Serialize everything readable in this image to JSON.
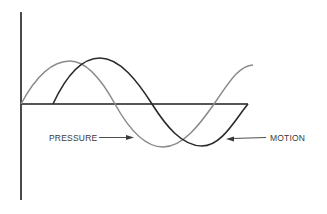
{
  "diagram": {
    "title": "",
    "labels": {
      "pressure": "PRESSURE",
      "motion": "MOTION"
    },
    "colors": {
      "pressure_curve": "#8a8a8a",
      "motion_curve": "#2a2a2a",
      "axes": "#1e1e1e",
      "text": "#3a3a3a",
      "background": "#ffffff"
    },
    "curves": [
      {
        "name": "pressure",
        "shape": "sine",
        "phase": "leading",
        "cycles": 1.25
      },
      {
        "name": "motion",
        "shape": "sine",
        "phase": "lagging quarter period",
        "cycles": 1.0
      }
    ]
  }
}
